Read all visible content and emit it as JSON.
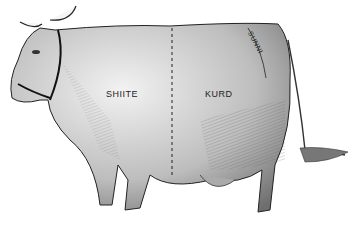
{
  "illustration": {
    "subject": "cow divided into regions",
    "regions": [
      {
        "id": "shiite",
        "label": "SHIITE"
      },
      {
        "id": "kurd",
        "label": "KURD"
      },
      {
        "id": "sunni",
        "label": "SUNNI"
      }
    ],
    "colors": {
      "ink": "#1a1a1a",
      "shade": "#8a8a8a",
      "background": "#ffffff"
    }
  }
}
